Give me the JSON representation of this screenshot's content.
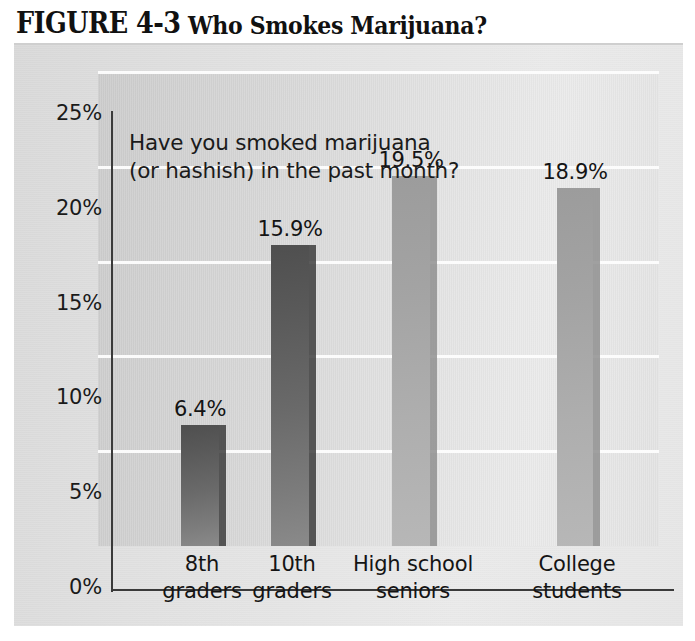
{
  "figure": {
    "label": "FIGURE 4-3",
    "name": "Who Smokes Marijuana?"
  },
  "chart_data": {
    "type": "bar",
    "title": "Who Smokes Marijuana?",
    "annotation": "Have you smoked marijuana\n(or hashish) in the past month?",
    "xlabel": "",
    "ylabel": "",
    "categories": [
      "8th\ngraders",
      "10th\ngraders",
      "High school\nseniors",
      "College\nstudents"
    ],
    "category_names": [
      "8th graders",
      "10th graders",
      "High school seniors",
      "College students"
    ],
    "values": [
      6.4,
      15.9,
      19.5,
      18.9
    ],
    "value_labels": [
      "6.4%",
      "15.9%",
      "19.5%",
      "18.9%"
    ],
    "ylim": [
      0,
      25
    ],
    "yticks": [
      0,
      5,
      10,
      15,
      20,
      25
    ],
    "ytick_labels": [
      "0%",
      "5%",
      "10%",
      "15%",
      "20%",
      "25%"
    ],
    "grid": true,
    "legend": false,
    "bar_styles": [
      "dark",
      "dark",
      "light",
      "light"
    ],
    "colors": {
      "bar_dark": "#6a6a6a",
      "bar_light": "#aeaeae",
      "bar_shadow_dark": "#3d3d3d",
      "bar_shadow_light": "#8f8f8f",
      "plot_background": "#dcdcdc",
      "panel_background": "#e2e2e2",
      "gridline": "#fdfdfd",
      "axis": "#3a3a3a",
      "text": "#141414"
    }
  }
}
